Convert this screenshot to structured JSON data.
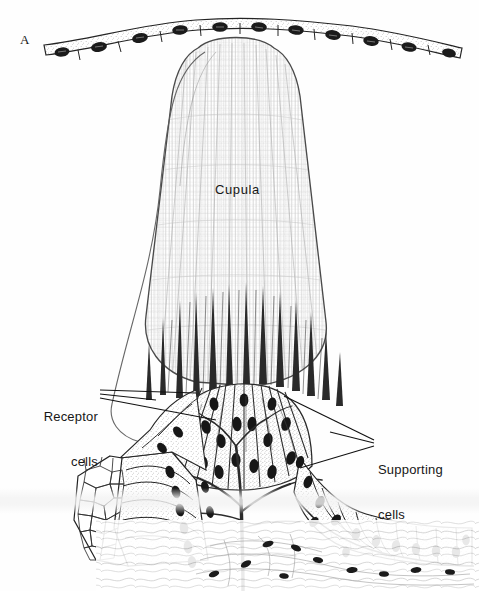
{
  "figure": {
    "panel_letter": "A",
    "background_color": "#fefefe",
    "ink_color": "#1a1a1a"
  },
  "labels": {
    "cupula": "Cupula",
    "receptor_line1": "Receptor",
    "receptor_line2": "cells",
    "supporting_line1": "Supporting",
    "supporting_line2": "cells"
  },
  "structures": {
    "cupula": {
      "name": "cupula",
      "description": "tall rounded gelatinous dome with fine vertical fibrillar striations",
      "apex_y": 48,
      "base_y": 400,
      "fill": "#fdfdfd",
      "stroke": "#555555"
    },
    "surface_epithelium": {
      "name": "surface-epithelium-row",
      "cell_count": 11,
      "description": "wavy row of squamous epithelial cells each containing one dark oval nucleus",
      "y": 36
    },
    "neuromast": {
      "name": "neuromast-sensory-mound",
      "receptor_cell_count": 12,
      "description": "mound of radiating pear-shaped receptor cells with basal nuclei"
    },
    "hair_bundles": {
      "name": "sensory-hair-bundles",
      "count": 13,
      "description": "tapering dark hairs projecting from receptor cells into cupula base"
    },
    "supporting_epithelium_left": {
      "name": "supporting-cells-left",
      "cell_count": 8,
      "description": "tall columnar supporting cells with dark nuclei"
    },
    "supporting_epithelium_right": {
      "name": "supporting-cells-right",
      "cell_count": 13,
      "description": "tall columnar supporting cells with dark nuclei"
    },
    "surface_view_patch": {
      "name": "polygonal-surface-view-patch",
      "description": "en-face polygonal mosaic of epithelial cell outlines on lower left"
    },
    "nerve": {
      "name": "nerve-fiber-tree",
      "description": "dark branching nerve fibres ascending to the sensory cells"
    },
    "connective_tissue": {
      "name": "subepithelial-connective-tissue",
      "description": "loose wavy fibrous tissue with scattered elongated nuclei below basement membrane"
    }
  },
  "leaders": {
    "receptor_leader_count": 2,
    "supporting_leader_count": 2
  }
}
